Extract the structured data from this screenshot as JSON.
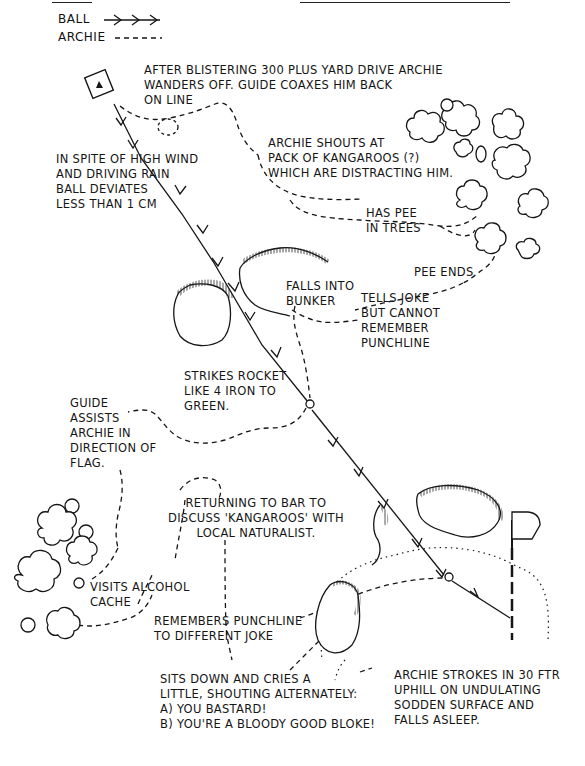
{
  "legend": {
    "ball_label": "BALL",
    "ball_symbol": "→→→",
    "archie_label": "ARCHIE",
    "archie_symbol": "-----"
  },
  "annotations": {
    "drive": "AFTER BLISTERING 300 PLUS YARD DRIVE ARCHIE\nWANDERS OFF. GUIDE COAXES HIM BACK\nON LINE",
    "kangaroos": "ARCHIE SHOUTS AT\nPACK OF KANGAROOS (?)\nWHICH ARE DISTRACTING HIM.",
    "wind": "IN SPITE OF HIGH WIND\nAND DRIVING RAIN\nBALL DEVIATES\nLESS THAN 1 CM",
    "pee": "HAS PEE\nIN TREES",
    "pee_ends": "PEE ENDS",
    "bunker": "FALLS INTO\nBUNKER",
    "joke": "TELLS JOKE\nBUT CANNOT\nREMEMBER\nPUNCHLINE",
    "rocket": "STRIKES ROCKET\nLIKE 4 IRON TO\nGREEN.",
    "guide": "GUIDE\nASSISTS\nARCHIE IN\nDIRECTION OF\nFLAG.",
    "bar": "RETURNING TO BAR TO\nDISCUSS 'KANGAROOS' WITH\nLOCAL NATURALIST.",
    "alcohol": "VISITS ALCOHOL\nCACHE",
    "punchline": "REMEMBERS PUNCHLINE\nTO DIFFERENT JOKE",
    "cries": "SITS DOWN AND CRIES A\nLITTLE, SHOUTING ALTERNATELY:\nA) YOU BASTARD!\nB) YOU'RE A BLOODY GOOD BLOKE!",
    "putt": "ARCHIE STROKES IN 30 FTR\nUPHILL ON UNDULATING\nSODDEN SURFACE AND\nFALLS ASLEEP."
  },
  "colors": {
    "ink": "#151515",
    "paper": "#ffffff"
  }
}
